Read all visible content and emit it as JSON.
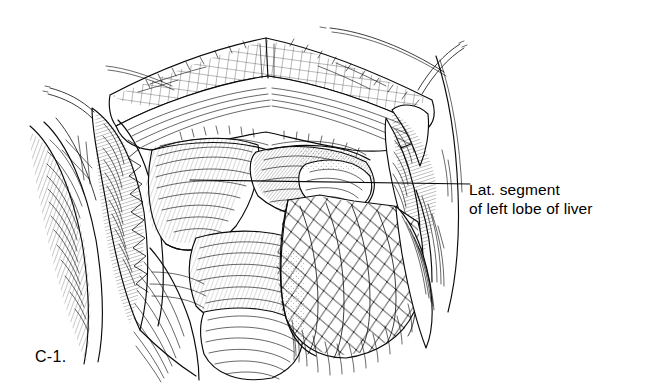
{
  "figure": {
    "number": "C-1.",
    "background_color": "#ffffff",
    "ink_color": "#0a0a0a",
    "style": "pen-and-ink line engraving / cross-hatched medical illustration"
  },
  "callouts": [
    {
      "id": "lat-segment-left-lobe",
      "line1": "Lat. segment",
      "line2": "of left lobe of liver",
      "leader": {
        "from_x": 470,
        "from_y": 184,
        "to_x": 190,
        "to_y": 180,
        "style": "straight horizontal leader line"
      }
    }
  ],
  "anatomy": {
    "structures": [
      "lateral segment of left lobe of liver",
      "greater omentum",
      "stomach",
      "transverse colon",
      "abdominal wall",
      "rectus muscle",
      "peritoneum",
      "falciform ligament"
    ],
    "instruments": [
      "retractor blade (left)",
      "retractor blade (right)",
      "retractor blade (superior)"
    ]
  }
}
